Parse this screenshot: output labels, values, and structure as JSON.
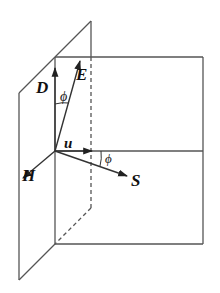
{
  "diagram": {
    "title": "",
    "labels": {
      "D": "D",
      "E": "E",
      "H": "H",
      "u": "u",
      "S": "S",
      "phi_top": "ϕ",
      "phi_right": "ϕ"
    },
    "colors": {
      "line": "#555555",
      "vector": "#333333",
      "text": "#111111",
      "background": "#ffffff"
    }
  }
}
